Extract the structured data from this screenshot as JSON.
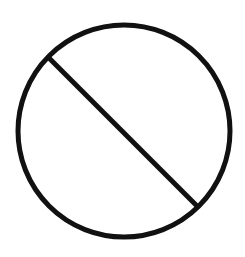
{
  "icon": {
    "name": "prohibited-icon",
    "stroke_color": "#111111",
    "background": "#ffffff"
  }
}
